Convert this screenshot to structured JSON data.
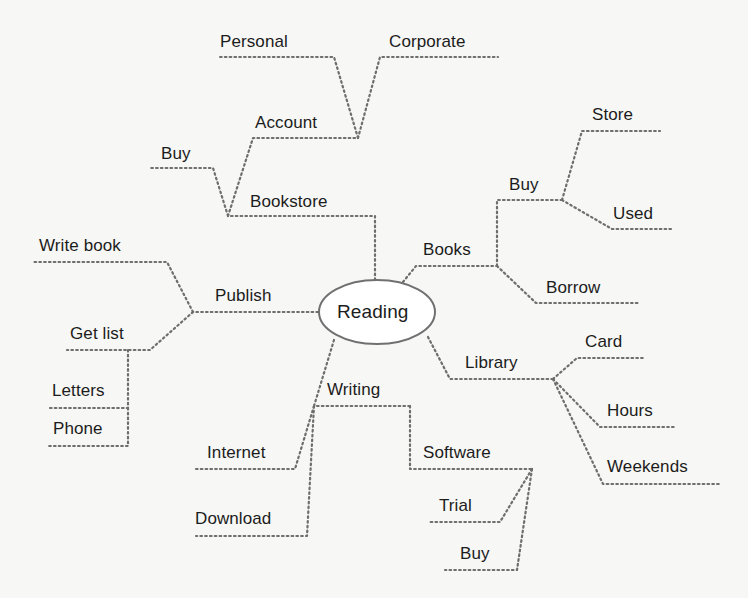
{
  "diagram": {
    "type": "mind-map",
    "center": {
      "label": "Reading"
    },
    "colors": {
      "background": "#f7f7f5",
      "line": "#6e6e6e",
      "text": "#1c1c1c",
      "ellipse_stroke": "#707070"
    },
    "branches": {
      "bookstore": {
        "label": "Bookstore",
        "children": {
          "buy": {
            "label": "Buy"
          },
          "account": {
            "label": "Account",
            "children": {
              "personal": {
                "label": "Personal"
              },
              "corporate": {
                "label": "Corporate"
              }
            }
          }
        }
      },
      "books": {
        "label": "Books",
        "children": {
          "buy": {
            "label": "Buy",
            "children": {
              "store": {
                "label": "Store"
              },
              "used": {
                "label": "Used"
              }
            }
          },
          "borrow": {
            "label": "Borrow"
          }
        }
      },
      "library": {
        "label": "Library",
        "children": {
          "card": {
            "label": "Card"
          },
          "hours": {
            "label": "Hours"
          },
          "weekends": {
            "label": "Weekends"
          }
        }
      },
      "writing": {
        "label": "Writing",
        "children": {
          "internet": {
            "label": "Internet"
          },
          "download": {
            "label": "Download"
          },
          "software": {
            "label": "Software",
            "children": {
              "trial": {
                "label": "Trial"
              },
              "buy": {
                "label": "Buy"
              }
            }
          }
        }
      },
      "publish": {
        "label": "Publish",
        "children": {
          "write_book": {
            "label": "Write book"
          },
          "get_list": {
            "label": "Get list",
            "children": {
              "letters": {
                "label": "Letters"
              },
              "phone": {
                "label": "Phone"
              }
            }
          }
        }
      }
    }
  }
}
